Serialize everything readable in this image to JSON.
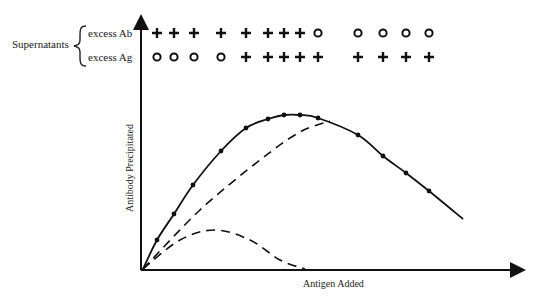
{
  "labels": {
    "supernatants": "Supernatants",
    "excess_ab": "excess Ab",
    "excess_ag": "excess Ag",
    "y_axis": "Antibody Precipitated",
    "x_axis": "Antigen Added"
  },
  "symbols": {
    "x_positions": [
      157,
      174,
      194,
      221,
      246,
      268,
      284,
      300,
      318,
      358,
      383,
      406,
      429
    ],
    "excess_ab_row": [
      "+",
      "+",
      "+",
      "+",
      "+",
      "+",
      "+",
      "+",
      "o",
      "o",
      "o",
      "o",
      "o"
    ],
    "excess_ag_row": [
      "o",
      "o",
      "o",
      "o",
      "+",
      "+",
      "+",
      "+",
      "+",
      "+",
      "+",
      "+",
      "+"
    ]
  },
  "chart_data": {
    "type": "line",
    "title": "",
    "xlabel": "Antigen Added",
    "ylabel": "Antibody Precipitated",
    "grid": false,
    "series": [
      {
        "name": "Total antibody precipitated (measured)",
        "style": "solid with points",
        "points_px": [
          [
            143,
            269
          ],
          [
            157,
            240
          ],
          [
            174,
            214
          ],
          [
            193,
            185
          ],
          [
            221,
            151
          ],
          [
            246,
            128
          ],
          [
            268,
            119
          ],
          [
            284,
            115
          ],
          [
            300,
            115
          ],
          [
            318,
            118
          ],
          [
            358,
            135
          ],
          [
            383,
            156
          ],
          [
            406,
            173
          ],
          [
            429,
            191
          ],
          [
            463,
            219
          ]
        ]
      },
      {
        "name": "Component curve (large)",
        "style": "dashed",
        "points_px": [
          [
            143,
            269
          ],
          [
            200,
            210
          ],
          [
            260,
            160
          ],
          [
            300,
            132
          ],
          [
            330,
            121
          ]
        ]
      },
      {
        "name": "Component curve (small)",
        "style": "dashed",
        "points_px": [
          [
            143,
            269
          ],
          [
            180,
            240
          ],
          [
            215,
            230
          ],
          [
            250,
            240
          ],
          [
            280,
            260
          ],
          [
            305,
            269
          ]
        ]
      }
    ]
  }
}
